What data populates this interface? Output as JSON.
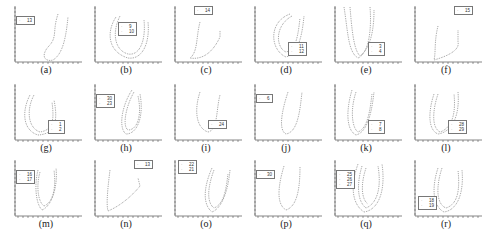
{
  "chart_data": {
    "type": "scatter",
    "title": "",
    "grid": false,
    "panels": [
      {
        "caption": "(a)",
        "legend": [
          "13"
        ],
        "legend_pos": "left"
      },
      {
        "caption": "(b)",
        "legend": [
          "9",
          "10"
        ],
        "legend_pos": "center"
      },
      {
        "caption": "(c)",
        "legend": [
          "14"
        ],
        "legend_pos": "top"
      },
      {
        "caption": "(d)",
        "legend": [
          "11",
          "12"
        ],
        "legend_pos": "bottom-right"
      },
      {
        "caption": "(e)",
        "legend": [
          "3",
          "4"
        ],
        "legend_pos": "bottom-right"
      },
      {
        "caption": "(f)",
        "legend": [
          "15"
        ],
        "legend_pos": "top-right"
      },
      {
        "caption": "(g)",
        "legend": [
          "1",
          "2"
        ],
        "legend_pos": "bottom-right"
      },
      {
        "caption": "(h)",
        "legend": [
          "30",
          "23"
        ],
        "legend_pos": "left"
      },
      {
        "caption": "(i)",
        "legend": [
          "24"
        ],
        "legend_pos": "bottom-right"
      },
      {
        "caption": "(j)",
        "legend": [
          "6"
        ],
        "legend_pos": "left"
      },
      {
        "caption": "(k)",
        "legend": [
          "7",
          "8"
        ],
        "legend_pos": "bottom-right"
      },
      {
        "caption": "(l)",
        "legend": [
          "28",
          "29"
        ],
        "legend_pos": "bottom-right"
      },
      {
        "caption": "(m)",
        "legend": [
          "16",
          "17"
        ],
        "legend_pos": "left"
      },
      {
        "caption": "(n)",
        "legend": [
          "13"
        ],
        "legend_pos": "top-right"
      },
      {
        "caption": "(o)",
        "legend": [
          "22",
          "21"
        ],
        "legend_pos": "top-left"
      },
      {
        "caption": "(p)",
        "legend": [
          "30"
        ],
        "legend_pos": "left"
      },
      {
        "caption": "(q)",
        "legend": [
          "25",
          "26",
          "27"
        ],
        "legend_pos": "left"
      },
      {
        "caption": "(r)",
        "legend": [
          "18",
          "19"
        ],
        "legend_pos": "bottom-left"
      }
    ]
  }
}
